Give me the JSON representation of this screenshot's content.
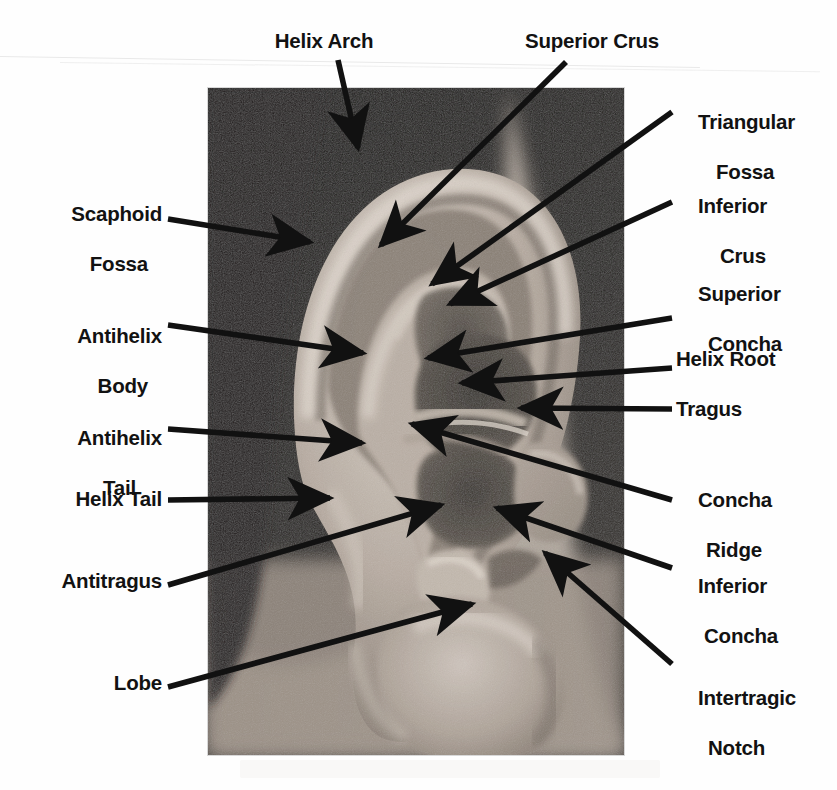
{
  "figure": {
    "kind": "labeled-anatomical-photograph",
    "background_color": "#ffffff",
    "label_color": "#121212",
    "arrow_color": "#111111",
    "photo": {
      "x": 208,
      "y": 88,
      "width": 416,
      "height": 667,
      "style": "black-and-white photograph"
    }
  },
  "labels": [
    {
      "id": "helix-arch",
      "text": "Helix Arch",
      "lines": [
        "Helix Arch"
      ],
      "side": "top",
      "align": "center",
      "x": 324,
      "y": 28,
      "tip": [
        358,
        148
      ]
    },
    {
      "id": "superior-crus",
      "text": "Superior Crus",
      "lines": [
        "Superior Crus"
      ],
      "side": "top",
      "align": "center",
      "x": 592,
      "y": 28,
      "tip": [
        381,
        245
      ]
    },
    {
      "id": "triangular-fossa",
      "text": "Triangular Fossa",
      "lines": [
        "Triangular",
        "Fossa"
      ],
      "side": "right",
      "align": "left",
      "x": 676,
      "y": 84,
      "tip": [
        432,
        284
      ]
    },
    {
      "id": "inferior-crus",
      "text": "Inferior Crus",
      "lines": [
        "Inferior",
        "Crus"
      ],
      "side": "right",
      "align": "left",
      "x": 676,
      "y": 168,
      "tip": [
        450,
        304
      ]
    },
    {
      "id": "scaphoid-fossa",
      "text": "Scaphoid Fossa",
      "lines": [
        "Scaphoid",
        "Fossa"
      ],
      "side": "left",
      "align": "right",
      "x": 160,
      "y": 176,
      "tip": [
        310,
        242
      ]
    },
    {
      "id": "antihelix-body",
      "text": "Antihelix Body",
      "lines": [
        "Antihelix",
        "Body"
      ],
      "side": "left",
      "align": "right",
      "x": 160,
      "y": 298,
      "tip": [
        363,
        353
      ]
    },
    {
      "id": "superior-concha",
      "text": "Superior Concha",
      "lines": [
        "Superior",
        "Concha"
      ],
      "side": "right",
      "align": "left",
      "x": 676,
      "y": 256,
      "tip": [
        428,
        358
      ]
    },
    {
      "id": "helix-root",
      "text": "Helix Root",
      "lines": [
        "Helix Root"
      ],
      "side": "right",
      "align": "left",
      "x": 676,
      "y": 346,
      "tip": [
        462,
        383
      ]
    },
    {
      "id": "tragus",
      "text": "Tragus",
      "lines": [
        "Tragus"
      ],
      "side": "right",
      "align": "left",
      "x": 676,
      "y": 396,
      "tip": [
        521,
        408
      ]
    },
    {
      "id": "antihelix-tail",
      "text": "Antihelix Tail",
      "lines": [
        "Antihelix",
        "Tail"
      ],
      "side": "left",
      "align": "right",
      "x": 160,
      "y": 400,
      "tip": [
        362,
        443
      ]
    },
    {
      "id": "concha-ridge",
      "text": "Concha Ridge",
      "lines": [
        "Concha",
        "Ridge"
      ],
      "side": "right",
      "align": "left",
      "x": 676,
      "y": 462,
      "tip": [
        412,
        424
      ]
    },
    {
      "id": "helix-tail",
      "text": "Helix Tail",
      "lines": [
        "Helix Tail"
      ],
      "side": "left",
      "align": "right",
      "x": 160,
      "y": 486,
      "tip": [
        330,
        498
      ]
    },
    {
      "id": "inferior-concha",
      "text": "Inferior Concha",
      "lines": [
        "Inferior",
        "Concha"
      ],
      "side": "right",
      "align": "left",
      "x": 676,
      "y": 548,
      "tip": [
        497,
        508
      ]
    },
    {
      "id": "antitragus",
      "text": "Antitragus",
      "lines": [
        "Antitragus"
      ],
      "side": "left",
      "align": "right",
      "x": 160,
      "y": 568,
      "tip": [
        441,
        505
      ]
    },
    {
      "id": "intertragic-notch",
      "text": "Intertragic Notch",
      "lines": [
        "Intertragic",
        "Notch"
      ],
      "side": "right",
      "align": "left",
      "x": 676,
      "y": 660,
      "tip": [
        545,
        553
      ]
    },
    {
      "id": "lobe",
      "text": "Lobe",
      "lines": [
        "Lobe"
      ],
      "side": "left",
      "align": "right",
      "x": 160,
      "y": 670,
      "tip": [
        472,
        604
      ]
    }
  ]
}
